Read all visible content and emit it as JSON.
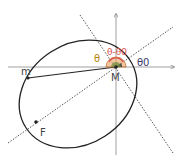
{
  "labels": {
    "theta": "θ",
    "theta_minus_theta0": "θ-θ0",
    "theta0": "θ0",
    "m": "m",
    "M": "M",
    "F": "F"
  },
  "colors": {
    "theta": "#b8860b",
    "theta_minus_theta0": "#d9534f",
    "theta0": "#3a3a6a",
    "line": "#222222",
    "dotted": "#555555",
    "axis": "#888888"
  },
  "points": {
    "M": [
      116,
      67
    ],
    "m": [
      28,
      78
    ],
    "F": [
      36,
      122
    ]
  }
}
